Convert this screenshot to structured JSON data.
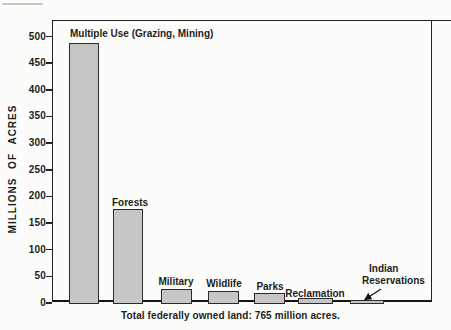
{
  "chart_data": {
    "type": "bar",
    "title": "",
    "ylabel": "MILLIONS OF ACRES",
    "xlabel": "",
    "caption": "Total federally owned land: 765 million acres.",
    "categories": [
      "Multiple Use (Grazing, Mining)",
      "Forests",
      "Military",
      "Wildlife",
      "Parks",
      "Reclamation",
      "Indian Reservations"
    ],
    "values": [
      485,
      175,
      25,
      20,
      16,
      8,
      4
    ],
    "ylim": [
      0,
      500
    ],
    "yticks": [
      0,
      50,
      100,
      150,
      200,
      250,
      300,
      350,
      400,
      450,
      500
    ],
    "grid": false,
    "legend": "none",
    "annotation": {
      "label_line1": "Indian",
      "label_line2": "Reservations",
      "target": "Indian Reservations bar"
    },
    "colors": {
      "bar_fill": "#c6c6c6",
      "bar_border": "#2b2b2b",
      "axis": "#222222",
      "text": "#1d1d1d",
      "background": "#fcfcfa"
    }
  }
}
